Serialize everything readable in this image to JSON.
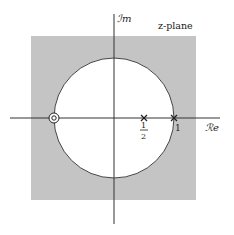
{
  "diagram": {
    "title": "z-plane",
    "axes": {
      "imaginary_label": "ℐm",
      "real_label": "ℛe"
    },
    "unit_circle": {
      "radius": 1,
      "roc": "outside-shaded"
    },
    "poles": [
      {
        "value": 0.5,
        "label_num": "1",
        "label_den": "2",
        "marker": "x"
      },
      {
        "value": 1,
        "label": "1",
        "marker": "x"
      }
    ],
    "zeros": [
      {
        "value": -1,
        "order": 2,
        "marker": "double-circle"
      }
    ],
    "colors": {
      "region": "#c4c4c4",
      "inner": "#ffffff",
      "line": "#333333"
    }
  }
}
